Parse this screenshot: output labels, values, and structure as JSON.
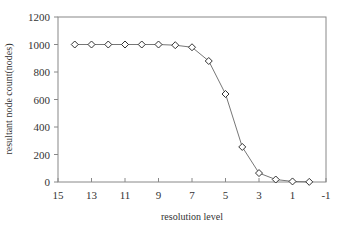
{
  "chart_data": {
    "type": "line",
    "title": "",
    "xlabel": "resolution level",
    "ylabel": "resultant node count(nodes)",
    "xlim": [
      15,
      -1
    ],
    "ylim": [
      0,
      1200
    ],
    "x_reversed": true,
    "x_ticks": [
      15,
      13,
      11,
      9,
      7,
      5,
      3,
      1,
      -1
    ],
    "y_ticks": [
      0,
      200,
      400,
      600,
      800,
      1000,
      1200
    ],
    "grid": false,
    "legend": null,
    "marker": "diamond",
    "series": [
      {
        "name": "node count",
        "x": [
          14,
          13,
          12,
          11,
          10,
          9,
          8,
          7,
          6,
          5,
          4,
          3,
          2,
          1,
          0
        ],
        "values": [
          1000,
          1000,
          1000,
          1000,
          1000,
          1000,
          995,
          980,
          880,
          640,
          255,
          65,
          18,
          4,
          1
        ]
      }
    ]
  },
  "colors": {
    "axis": "#888888",
    "line": "#777777",
    "marker_edge": "#333333",
    "marker_fill": "#ffffff"
  }
}
